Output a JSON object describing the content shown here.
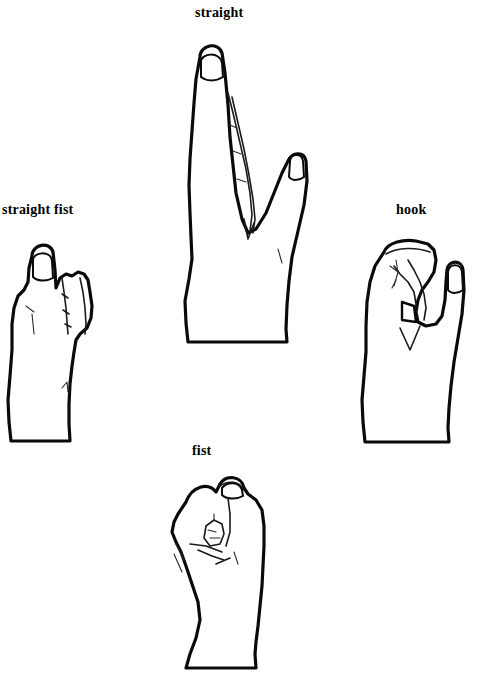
{
  "page": {
    "background_color": "#ffffff",
    "ink_color": "#000000",
    "width": 485,
    "height": 694
  },
  "figures": [
    {
      "id": "straight",
      "label": "straight",
      "icon": "hand-straight-finger-icon",
      "position": "top-center",
      "description": "Hand in profile with index finger fully extended straight up and thumb bent alongside"
    },
    {
      "id": "straight-fist",
      "label": "straight fist",
      "icon": "hand-straight-fist-icon",
      "position": "middle-left",
      "description": "Hand in profile with index finger extended straight and remaining fingers curled into a fist"
    },
    {
      "id": "hook",
      "label": "hook",
      "icon": "hand-hook-icon",
      "position": "middle-right",
      "description": "Hand in profile with fingers bent into a hook grip and thumb extended upward"
    },
    {
      "id": "fist",
      "label": "fist",
      "icon": "hand-fist-icon",
      "position": "bottom-center",
      "description": "Hand in profile fully closed into a fist with thumb folded over the fingers"
    }
  ]
}
